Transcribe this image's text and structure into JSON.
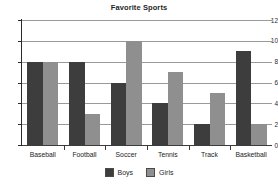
{
  "chart_data": {
    "type": "bar",
    "title": "Favorite Sports",
    "xlabel": "",
    "ylabel": "",
    "ylim": [
      0,
      12
    ],
    "yticks": [
      0,
      2,
      4,
      6,
      8,
      10,
      12
    ],
    "grid": true,
    "legend_position": "bottom",
    "categories": [
      "Baseball",
      "Football",
      "Soccer",
      "Tennis",
      "Track",
      "Basketball"
    ],
    "series": [
      {
        "name": "Boys",
        "color": "#3d3d3d",
        "values": [
          8,
          8,
          6,
          4,
          2,
          9
        ]
      },
      {
        "name": "Girls",
        "color": "#8f8f8f",
        "values": [
          8,
          3,
          10,
          7,
          5,
          2
        ]
      }
    ]
  },
  "colors": {
    "background": "#ffffff",
    "axis": "#2a2a2a",
    "gridline": "#9a9a9a",
    "text": "#1f1f1f"
  }
}
